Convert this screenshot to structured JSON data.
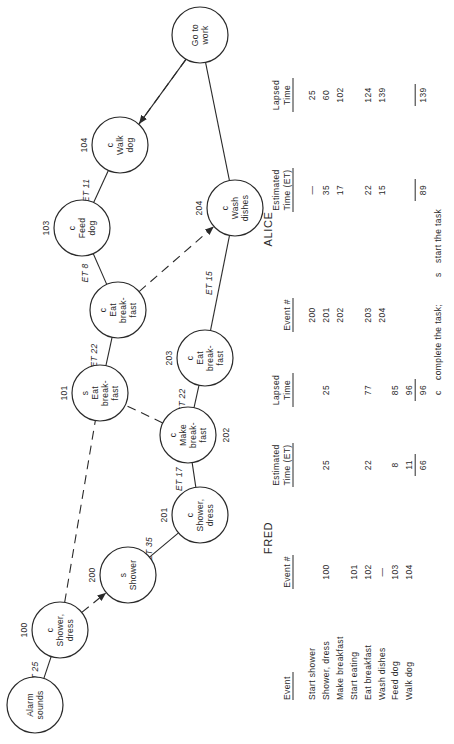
{
  "diagram": {
    "orientation": "rotated 90° counter-clockwise",
    "nodes": [
      {
        "key": "alarm",
        "id": "",
        "status": "",
        "label": [
          "Alarm",
          "sounds"
        ]
      },
      {
        "key": "n100",
        "id": "100",
        "status": "c",
        "label": [
          "Shower,",
          "dress"
        ]
      },
      {
        "key": "n200",
        "id": "200",
        "status": "s",
        "label": [
          "Shower"
        ]
      },
      {
        "key": "n201",
        "id": "201",
        "status": "c",
        "label": [
          "Shower,",
          "dress"
        ]
      },
      {
        "key": "n202",
        "id": "202",
        "status": "c",
        "label": [
          "Make",
          "break-",
          "fast"
        ]
      },
      {
        "key": "n203",
        "id": "203",
        "status": "c",
        "label": [
          "Eat",
          "break-",
          "fast"
        ]
      },
      {
        "key": "n101",
        "id": "101",
        "status": "s",
        "label": [
          "Eat",
          "break-",
          "fast"
        ]
      },
      {
        "key": "n102",
        "id": "",
        "status": "c",
        "label": [
          "Eat",
          "break-",
          "fast"
        ]
      },
      {
        "key": "n103",
        "id": "103",
        "status": "c",
        "label": [
          "Feed",
          "dog"
        ]
      },
      {
        "key": "n104",
        "id": "104",
        "status": "c",
        "label": [
          "Walk",
          "dog"
        ]
      },
      {
        "key": "n204",
        "id": "204",
        "status": "c",
        "label": [
          "Wash",
          "dishes"
        ]
      },
      {
        "key": "work",
        "id": "",
        "status": "",
        "label": [
          "Go to",
          "work"
        ]
      }
    ],
    "edges": [
      {
        "from": "alarm",
        "to": "n100",
        "style": "solid",
        "label": "ET 25"
      },
      {
        "from": "n100",
        "to": "n200",
        "style": "dashed-arrow",
        "label": ""
      },
      {
        "from": "n100",
        "to": "n101",
        "style": "dashed",
        "label": ""
      },
      {
        "from": "n200",
        "to": "n201",
        "style": "solid",
        "label": "ET 35"
      },
      {
        "from": "n201",
        "to": "n202",
        "style": "solid",
        "label": "ET 17"
      },
      {
        "from": "n202",
        "to": "n101",
        "style": "dashed",
        "label": ""
      },
      {
        "from": "n202",
        "to": "n203",
        "style": "solid",
        "label": "ET 22"
      },
      {
        "from": "n101",
        "to": "n102",
        "style": "solid",
        "label": "ET 22"
      },
      {
        "from": "n102",
        "to": "n103",
        "style": "solid",
        "label": "ET 8"
      },
      {
        "from": "n102",
        "to": "n204",
        "style": "dashed-arrow",
        "label": ""
      },
      {
        "from": "n103",
        "to": "n104",
        "style": "solid",
        "label": "ET 11"
      },
      {
        "from": "n203",
        "to": "n204",
        "style": "solid",
        "label": "ET 15"
      },
      {
        "from": "n104",
        "to": "work",
        "style": "solid",
        "label": ""
      },
      {
        "from": "work",
        "to": "n104",
        "style": "dashed-arrow",
        "label": ""
      },
      {
        "from": "n204",
        "to": "work",
        "style": "solid",
        "label": ""
      }
    ]
  },
  "event_list": {
    "header": "Event",
    "rows": [
      "Start shower",
      "Shower, dress",
      "Make breakfast",
      "Start eating",
      "Eat breakfast",
      "Wash dishes",
      "Feed dog",
      "Walk dog"
    ]
  },
  "fred": {
    "title": "FRED",
    "col_event": "Event #",
    "col_et": [
      "Estimated",
      "Time (ET)"
    ],
    "col_lapsed": [
      "Lapsed",
      "Time"
    ],
    "rows": [
      {
        "event": "",
        "et": "",
        "lapsed": ""
      },
      {
        "event": "100",
        "et": "25",
        "lapsed": "25"
      },
      {
        "event": "",
        "et": "",
        "lapsed": ""
      },
      {
        "event": "101",
        "et": "",
        "lapsed": ""
      },
      {
        "event": "102",
        "et": "22",
        "lapsed": "77"
      },
      {
        "event": "—",
        "et": "",
        "lapsed": ""
      },
      {
        "event": "103",
        "et": "8",
        "lapsed": "85"
      },
      {
        "event": "104",
        "et": "11",
        "lapsed": "96"
      }
    ],
    "total_et": "66",
    "total_lapsed": "96"
  },
  "alice": {
    "title": "ALICE",
    "col_event": "Event #",
    "col_et": [
      "Estimated",
      "Time (ET)"
    ],
    "col_lapsed": [
      "Lapsed",
      "Time"
    ],
    "rows": [
      {
        "event": "200",
        "et": "—",
        "lapsed": "25"
      },
      {
        "event": "201",
        "et": "35",
        "lapsed": "60"
      },
      {
        "event": "202",
        "et": "17",
        "lapsed": "102"
      },
      {
        "event": "",
        "et": "",
        "lapsed": ""
      },
      {
        "event": "203",
        "et": "22",
        "lapsed": "124"
      },
      {
        "event": "204",
        "et": "15",
        "lapsed": "139"
      },
      {
        "event": "",
        "et": "",
        "lapsed": ""
      },
      {
        "event": "",
        "et": "",
        "lapsed": ""
      }
    ],
    "total_et": "89",
    "total_lapsed": "139"
  },
  "legend": {
    "c_key": "c",
    "c_text": "complete the task;",
    "s_key": "s",
    "s_text": "start the task"
  }
}
